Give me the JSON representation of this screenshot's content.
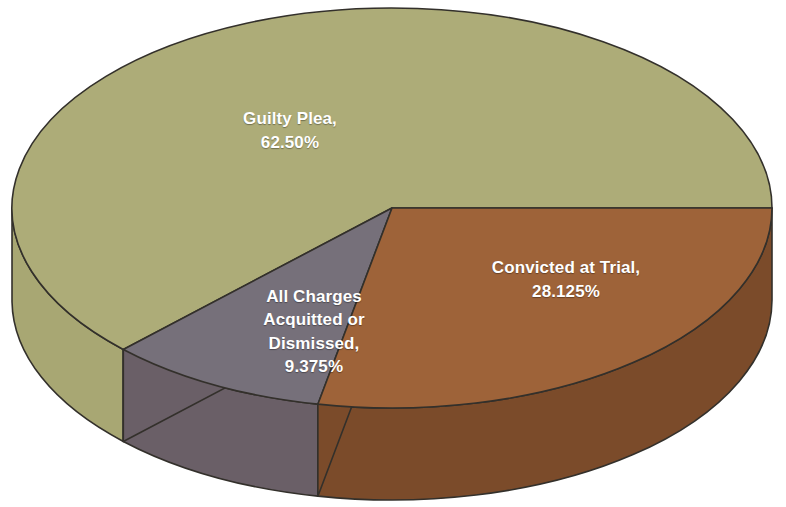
{
  "chart_data": {
    "type": "pie",
    "title": "",
    "subtitle": "",
    "xlabel": "",
    "ylabel": "",
    "three_d": true,
    "legend_position": "none",
    "grid": false,
    "labels_inside_slices": true,
    "categories": [
      "Guilty Plea",
      "Convicted at Trial",
      "All Charges Acquitted or Dismissed"
    ],
    "values": [
      62.5,
      28.125,
      9.375
    ],
    "value_unit": "%",
    "slices": [
      {
        "name": "guilty-plea",
        "label": "Guilty Plea,",
        "value_text": "62.50%",
        "value": 62.5,
        "color_top": "#adac78",
        "color_side": "#a8a773",
        "start_angle_deg": 0,
        "sweep_deg": 225
      },
      {
        "name": "convicted-at-trial",
        "label": "Convicted at Trial,",
        "value_text": "28.125%",
        "value": 28.125,
        "color_top": "#9e6339",
        "color_side": "#7b4b2a",
        "start_angle_deg": 258.75,
        "sweep_deg": 101.25
      },
      {
        "name": "all-charges-acquitted-or-dismissed",
        "label": "All Charges\nAcquitted or\nDismissed,",
        "value_text": "9.375%",
        "value": 9.375,
        "color_top": "#76707a",
        "color_side": "#6a5f67",
        "start_angle_deg": 225,
        "sweep_deg": 33.75
      }
    ],
    "colors": {
      "background": "#ffffff",
      "outline": "#33302b",
      "label_text": "#ffffff",
      "guilty_plea": "#adac78",
      "convicted_at_trial": "#9e6339",
      "acquitted_or_dismissed": "#76707a"
    }
  },
  "labels": {
    "guilty_plea": "Guilty Plea,\n62.50%",
    "convicted_at_trial": "Convicted at Trial,\n28.125%",
    "acquitted_or_dismissed": "All Charges\nAcquitted or\nDismissed,\n9.375%"
  }
}
